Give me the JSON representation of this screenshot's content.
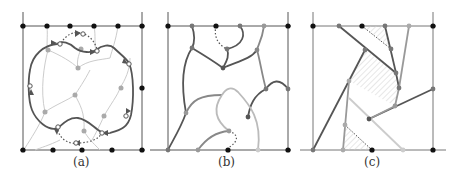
{
  "figure": {
    "colors": {
      "frame": "#555555",
      "black_node": "#111111",
      "dark_curve": "#555555",
      "mid_curve": "#888888",
      "light_curve": "#bbbbbb",
      "faint_curve": "#cccccc",
      "hatch": "#cccccc"
    },
    "panels": [
      {
        "id": "a",
        "label": "(a)",
        "description": "Closed oriented loop with arrow markers around a grid of gray nodes, dotted arcs at top and bottom"
      },
      {
        "id": "b",
        "label": "(b)",
        "description": "Curved branching tree-like paths connecting boundary nodes, in shades of gray"
      },
      {
        "id": "c",
        "label": "(c)",
        "description": "Straight-line version of the paths with hatched regions"
      }
    ]
  }
}
